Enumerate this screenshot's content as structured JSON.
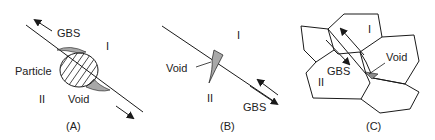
{
  "panels": [
    {
      "id": "A",
      "caption": "(A)",
      "labels": {
        "gbs": "GBS",
        "grain_top": "I",
        "grain_bottom": "II",
        "particle": "Particle",
        "void": "Void"
      }
    },
    {
      "id": "B",
      "caption": "(B)",
      "labels": {
        "gbs": "GBS",
        "grain_top": "I",
        "grain_bottom": "II",
        "void": "Void"
      }
    },
    {
      "id": "C",
      "caption": "(C)",
      "labels": {
        "gbs": "GBS",
        "grain_top": "I",
        "grain_bottom": "II",
        "void": "Void"
      }
    }
  ],
  "colors": {
    "line": "#1a1a1a",
    "void_fill": "#a8a8a8",
    "hatch": "#1a1a1a"
  }
}
